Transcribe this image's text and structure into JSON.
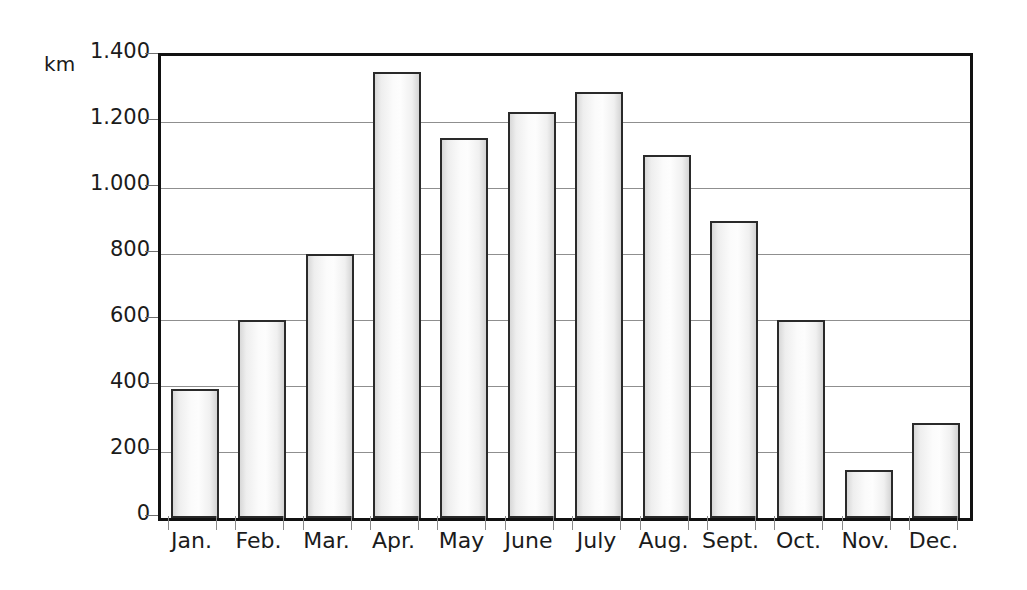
{
  "chart_data": {
    "type": "bar",
    "title": "",
    "subtitle": "",
    "xlabel": "",
    "ylabel": "km",
    "unit_label": "km",
    "categories": [
      "Jan.",
      "Feb.",
      "Mar.",
      "Apr.",
      "May",
      "June",
      "July",
      "Aug.",
      "Sept.",
      "Oct.",
      "Nov.",
      "Dec."
    ],
    "values": [
      390,
      600,
      800,
      1350,
      1150,
      1230,
      1290,
      1100,
      900,
      600,
      145,
      287
    ],
    "series": [
      {
        "name": "km",
        "values": [
          390,
          600,
          800,
          1350,
          1150,
          1230,
          1290,
          1100,
          900,
          600,
          145,
          287
        ]
      }
    ],
    "ylim": [
      0,
      1400
    ],
    "ytick_values": [
      0,
      200,
      400,
      600,
      800,
      1000,
      1200,
      1400
    ],
    "ytick_labels": [
      "0",
      "200",
      "400",
      "600",
      "800",
      "1.000",
      "1.200",
      "1.400"
    ],
    "grid": true,
    "grid_axis": "y",
    "legend": false,
    "legend_position": "none",
    "annotations": [],
    "colors": {
      "bar_fill_light": "#fdfdfd",
      "bar_fill_edge": "#d6d6d6",
      "bar_border": "#2a2a2a",
      "gridline": "#8f8f8f",
      "axis": "#111111",
      "text": "#1b1b1b",
      "background": "#ffffff"
    }
  }
}
